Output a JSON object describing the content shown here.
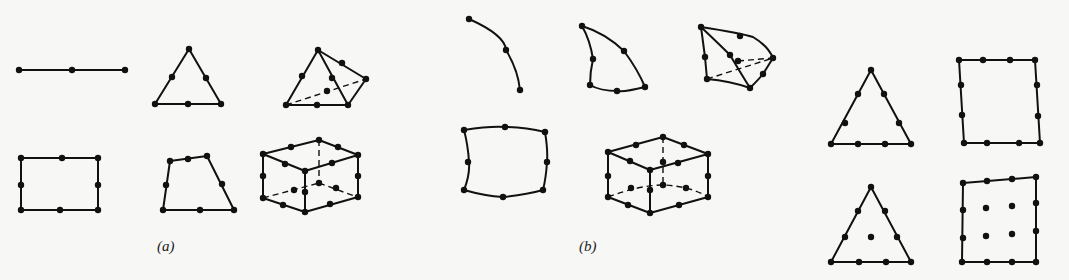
{
  "figure": {
    "panels": [
      {
        "id": "a",
        "label": "(a)",
        "description": "Linear/quadratic straight-sided elements",
        "elements": [
          "3-node line element",
          "6-node triangle",
          "10-node tetrahedron",
          "8-node rectangle",
          "8-node quadrilateral",
          "20-node hexahedron"
        ]
      },
      {
        "id": "b",
        "label": "(b)",
        "description": "Curved-sided isoparametric elements",
        "elements": [
          "3-node curved line element",
          "6-node curved triangle",
          "10-node curved tetrahedron",
          "8-node curved quadrilateral",
          "20-node curved hexahedron"
        ]
      },
      {
        "id": "c",
        "label": "",
        "description": "Higher-order (cubic) elements",
        "elements": [
          "9-node cubic triangle",
          "12-node serendipity quadrilateral",
          "10-node cubic triangle with centroid node",
          "16-node Lagrange quadrilateral"
        ]
      }
    ],
    "colors": {
      "background": "#f7f7f5",
      "ink": "#111111"
    }
  }
}
